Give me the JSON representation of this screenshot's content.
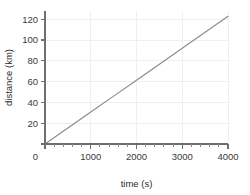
{
  "chart_data": {
    "type": "line",
    "title": "",
    "xlabel": "time (s)",
    "ylabel": "distance (km)",
    "xlim": [
      0,
      4000
    ],
    "ylim": [
      0,
      125
    ],
    "xticks": [
      0,
      1000,
      2000,
      3000,
      4000
    ],
    "xtick_labels": [
      "0",
      "1000",
      "2000",
      "3000",
      "4000"
    ],
    "yticks": [
      0,
      20,
      40,
      60,
      80,
      100,
      120
    ],
    "ytick_labels": [
      "0",
      "20",
      "40",
      "60",
      "80",
      "100",
      "120"
    ],
    "x_minor_tick_interval": 200,
    "grid": true,
    "grid_color": "#f0eef2",
    "legend": false,
    "legend_position": "none",
    "line_color": "#8c8c8c",
    "axis_color": "#6e6e6e",
    "series": [
      {
        "name": "distance",
        "x": [
          0,
          500,
          1000,
          1500,
          2000,
          2500,
          3000,
          3500,
          4000
        ],
        "values": [
          0,
          15,
          30,
          45,
          60,
          75,
          90,
          105,
          120
        ]
      }
    ]
  },
  "axes": {
    "x_title": "time (s)",
    "y_title": "distance (km)"
  }
}
